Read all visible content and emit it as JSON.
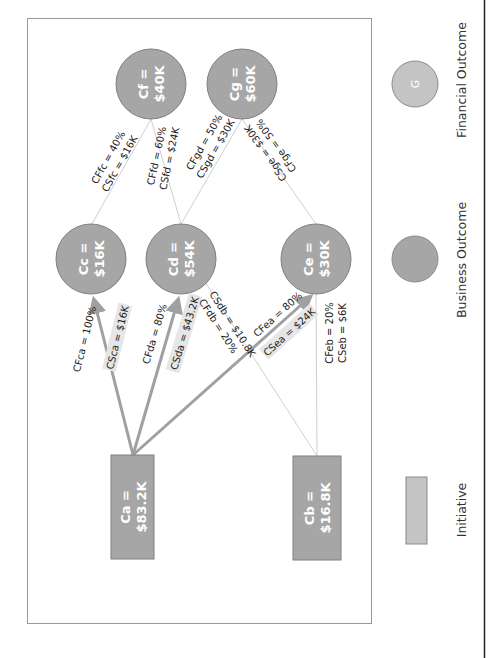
{
  "diagram": {
    "colors": {
      "node_fill": "#a6a6a6",
      "node_stroke": "#7f7f7f",
      "legend_fill": "#c4c4c4",
      "thick_edge": "#a0a0a0",
      "thin_edge": "#d0d0d0",
      "label_highlight": "#e6e6e6"
    },
    "nodes": {
      "ca": {
        "type": "initiative",
        "line1": "Ca =",
        "line2": "$83.2K"
      },
      "cb": {
        "type": "initiative",
        "line1": "Cb =",
        "line2": "$16.8K"
      },
      "cc": {
        "type": "business_outcome",
        "line1": "Cc =",
        "line2": "$16K"
      },
      "cd": {
        "type": "business_outcome",
        "line1": "Cd =",
        "line2": "$54K"
      },
      "ce": {
        "type": "business_outcome",
        "line1": "Ce =",
        "line2": "$30K"
      },
      "cf": {
        "type": "financial_outcome",
        "line1": "Cf =",
        "line2": "$40K"
      },
      "cg": {
        "type": "financial_outcome",
        "line1": "Cg =",
        "line2": "$60K"
      }
    },
    "edges": {
      "ca_cc": {
        "cf": "CFca = 100%",
        "cs": "CSca = $16K"
      },
      "ca_cd": {
        "cf": "CFda = 80%",
        "cs": "CSda = $43.2K"
      },
      "ca_ce": {
        "cf": "CFea = 80%",
        "cs": "CSea = $24K"
      },
      "cb_cd": {
        "cf": "CFdb = 20%",
        "cs": "CSdb = $10.8K"
      },
      "cb_ce": {
        "cf": "CFeb = 20%",
        "cs": "CSeb = $6K"
      },
      "cc_cf": {
        "cf": "CFfc = 40%",
        "cs": "CSfc = $16K"
      },
      "cd_cf": {
        "cf": "CFfd = 60%",
        "cs": "CSfd = $24K"
      },
      "cd_cg": {
        "cf": "CFgd = 50%",
        "cs": "CSgd = $30K"
      },
      "ce_cg": {
        "cf": "CFge = 50%",
        "cs": "CSge = $30K"
      }
    }
  },
  "legend": {
    "financial_outcome": {
      "symbol_label": "G",
      "label": "Financial Outcome"
    },
    "business_outcome": {
      "symbol_label": "",
      "label": "Business Outcome"
    },
    "initiative": {
      "symbol_label": "",
      "label": "Initiative"
    }
  }
}
